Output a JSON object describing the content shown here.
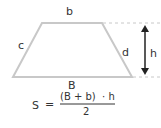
{
  "diagram": {
    "shape": "trapezoid",
    "labels": {
      "top_base": "b",
      "bottom_base": "B",
      "left_side": "c",
      "right_side": "d",
      "height": "h"
    },
    "formula": {
      "lhs": "S",
      "equals": "=",
      "numerator": "(B + b)  · h",
      "denominator": "2"
    },
    "colors": {
      "outline": "#c8c8c8",
      "dashed": "#c8c8c8",
      "arrow": "#222222",
      "text": "#333333"
    }
  }
}
